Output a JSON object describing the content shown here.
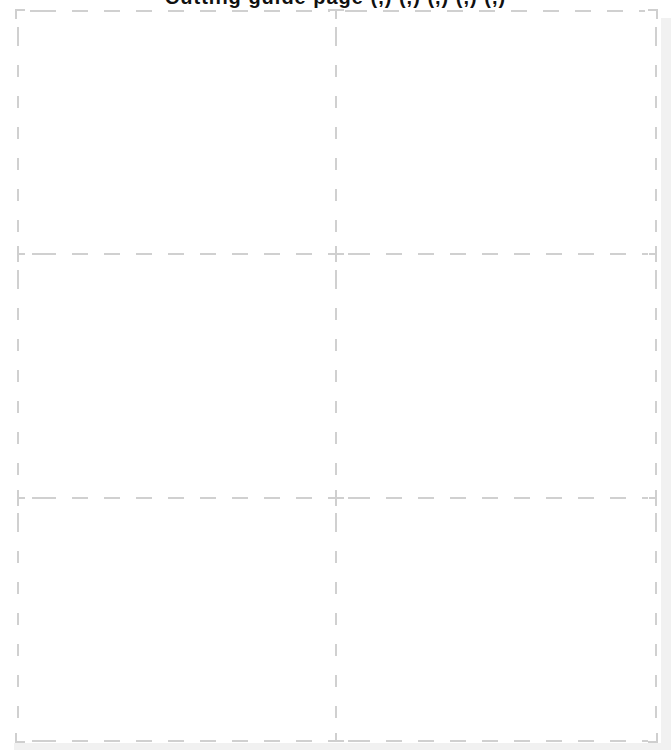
{
  "page": {
    "header_title": "Cutting guide page (,) (,) (,) (,) (,)",
    "header_clipped": true
  },
  "grid": {
    "rows": 3,
    "columns": 2,
    "cells": [
      {
        "row": 1,
        "col": 1,
        "content": ""
      },
      {
        "row": 1,
        "col": 2,
        "content": ""
      },
      {
        "row": 2,
        "col": 1,
        "content": ""
      },
      {
        "row": 2,
        "col": 2,
        "content": ""
      },
      {
        "row": 3,
        "col": 1,
        "content": ""
      },
      {
        "row": 3,
        "col": 2,
        "content": ""
      }
    ],
    "line_style": "dashed",
    "line_color": "#d0d0d0",
    "page_shadow_color": "#f1f1f1",
    "background_color": "#ffffff"
  }
}
